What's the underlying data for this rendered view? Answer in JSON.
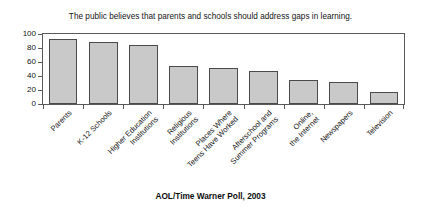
{
  "chart_data": {
    "type": "bar",
    "title": "The public believes that parents and schools should address gaps in learning.",
    "source_note": "AOL/Time Warner Poll, 2003",
    "xlabel": "",
    "ylabel": "",
    "ylim": [
      0,
      100
    ],
    "yticks": [
      0,
      20,
      40,
      60,
      80,
      100
    ],
    "ytick_labels": [
      "0",
      "20",
      "40",
      "60",
      "80",
      "100"
    ],
    "grid": false,
    "legend": false,
    "bar_color": "#c9c9c9",
    "bar_edge_color": "#4a4a4a",
    "categories": [
      "Parents",
      "K-12 Schools",
      "Higher Education Institutions",
      "Religious Institutions",
      "Places Where Teens Have Worked",
      "Afterschool and Summer Programs",
      "Online, the Internet",
      "Newspapers",
      "Television"
    ],
    "category_lines": [
      [
        "Parents",
        ""
      ],
      [
        "K-12 Schools",
        ""
      ],
      [
        "Higher Education",
        "Institutions"
      ],
      [
        "Religious",
        "Institutions"
      ],
      [
        "Places Where",
        "Teens Have Worked"
      ],
      [
        "Afterschool and",
        "Summer Programs"
      ],
      [
        "Online,",
        "the Internet"
      ],
      [
        "Newspapers",
        ""
      ],
      [
        "Television",
        ""
      ]
    ],
    "values": [
      93,
      89,
      84,
      54,
      52,
      47,
      34,
      32,
      17
    ]
  }
}
